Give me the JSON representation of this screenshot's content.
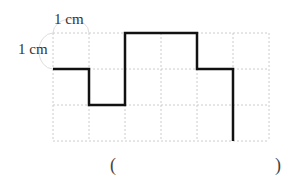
{
  "labels": {
    "top_unit": "1 cm",
    "left_unit": "1 cm"
  },
  "answer_blank": {
    "open": "(",
    "close": ")",
    "value": ""
  },
  "grid": {
    "columns": 6,
    "rows": 3,
    "cell_size_cm": 1,
    "origin_px": [
      53,
      33
    ],
    "cell_px": 36,
    "line_color": "#cccccc",
    "line_style": "dashed"
  },
  "path": {
    "color": "#111111",
    "stroke_width": 2.5,
    "points_grid": [
      [
        0,
        1
      ],
      [
        1,
        1
      ],
      [
        1,
        2
      ],
      [
        2,
        2
      ],
      [
        2,
        0
      ],
      [
        4,
        0
      ],
      [
        4,
        1
      ],
      [
        5,
        1
      ],
      [
        5,
        3
      ]
    ]
  },
  "colors": {
    "background": "#ffffff",
    "unit_arc": "#dddddd"
  }
}
